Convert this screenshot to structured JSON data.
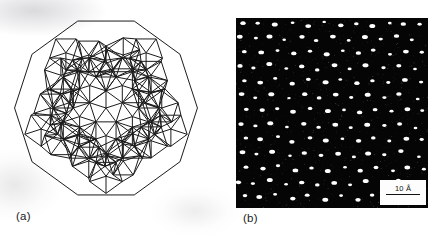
{
  "figure": {
    "type": "two-panel scientific figure",
    "background_color": "#ffffff",
    "width": 437,
    "height": 235
  },
  "panel_a": {
    "label": "(a)",
    "description": "decagonal quasicrystal tiling model",
    "line_color": "#1a1a1a",
    "fill_color": "none",
    "symmetry": "10-fold",
    "bounds": {
      "x": 13,
      "y": 15,
      "width": 177,
      "height": 185
    }
  },
  "panel_b": {
    "label": "(b)",
    "description": "high-resolution electron micrograph of quasicrystal",
    "background_color": "#050505",
    "dot_color": "#ffffff",
    "bounds": {
      "x": 236,
      "y": 18,
      "width": 192,
      "height": 190
    },
    "scalebar": {
      "label": "10 Å",
      "value": 10,
      "unit": "Å",
      "box_color": "#fdfdfd",
      "line_color": "#111111"
    }
  },
  "chart_data": {
    "type": "scatter",
    "title": "",
    "xlabel": "",
    "ylabel": "",
    "note": "Panel (b) bright spots are atomic column positions in a quasiperiodic lattice; coordinates are in micrograph pixel space (0-192 x, 0-190 y) with intensity r = blob radius.",
    "points": [
      [
        7,
        6,
        2.0
      ],
      [
        22,
        5,
        1.6
      ],
      [
        38,
        7,
        2.2
      ],
      [
        56,
        5,
        1.4
      ],
      [
        72,
        8,
        2.1
      ],
      [
        88,
        4,
        1.3
      ],
      [
        104,
        7,
        2.0
      ],
      [
        120,
        5,
        1.7
      ],
      [
        137,
        8,
        2.2
      ],
      [
        153,
        5,
        1.4
      ],
      [
        168,
        7,
        2.0
      ],
      [
        183,
        6,
        1.6
      ],
      [
        4,
        19,
        2.1
      ],
      [
        19,
        21,
        1.5
      ],
      [
        34,
        18,
        2.2
      ],
      [
        49,
        22,
        1.3
      ],
      [
        65,
        19,
        2.0
      ],
      [
        81,
        22,
        1.7
      ],
      [
        97,
        19,
        2.1
      ],
      [
        113,
        23,
        1.4
      ],
      [
        128,
        19,
        2.2
      ],
      [
        145,
        21,
        1.6
      ],
      [
        160,
        18,
        2.0
      ],
      [
        176,
        22,
        1.5
      ],
      [
        9,
        33,
        1.8
      ],
      [
        25,
        35,
        2.1
      ],
      [
        41,
        32,
        1.5
      ],
      [
        57,
        36,
        2.0
      ],
      [
        73,
        33,
        1.6
      ],
      [
        90,
        36,
        2.2
      ],
      [
        106,
        33,
        1.4
      ],
      [
        122,
        36,
        2.0
      ],
      [
        138,
        33,
        1.8
      ],
      [
        154,
        36,
        1.5
      ],
      [
        170,
        33,
        2.1
      ],
      [
        186,
        35,
        1.6
      ],
      [
        3,
        48,
        2.0
      ],
      [
        18,
        50,
        1.6
      ],
      [
        33,
        47,
        2.2
      ],
      [
        50,
        51,
        1.4
      ],
      [
        66,
        48,
        2.0
      ],
      [
        82,
        51,
        1.7
      ],
      [
        98,
        48,
        2.1
      ],
      [
        114,
        51,
        1.5
      ],
      [
        130,
        48,
        2.2
      ],
      [
        147,
        50,
        1.6
      ],
      [
        163,
        47,
        1.9
      ],
      [
        179,
        51,
        1.4
      ],
      [
        8,
        62,
        1.7
      ],
      [
        24,
        64,
        2.1
      ],
      [
        40,
        61,
        1.5
      ],
      [
        56,
        65,
        2.0
      ],
      [
        72,
        62,
        1.8
      ],
      [
        89,
        65,
        2.2
      ],
      [
        105,
        62,
        1.4
      ],
      [
        121,
        65,
        2.0
      ],
      [
        137,
        62,
        1.7
      ],
      [
        153,
        65,
        1.5
      ],
      [
        169,
        62,
        2.1
      ],
      [
        185,
        64,
        1.6
      ],
      [
        5,
        77,
        2.1
      ],
      [
        20,
        79,
        1.5
      ],
      [
        36,
        76,
        2.2
      ],
      [
        52,
        80,
        1.3
      ],
      [
        68,
        77,
        2.0
      ],
      [
        84,
        80,
        1.8
      ],
      [
        100,
        77,
        2.1
      ],
      [
        116,
        80,
        1.5
      ],
      [
        132,
        77,
        2.2
      ],
      [
        148,
        79,
        1.6
      ],
      [
        164,
        76,
        2.0
      ],
      [
        181,
        80,
        1.4
      ],
      [
        10,
        91,
        1.8
      ],
      [
        26,
        93,
        2.0
      ],
      [
        42,
        90,
        1.6
      ],
      [
        58,
        94,
        2.1
      ],
      [
        74,
        91,
        1.7
      ],
      [
        91,
        94,
        2.2
      ],
      [
        107,
        91,
        1.4
      ],
      [
        123,
        94,
        2.0
      ],
      [
        139,
        91,
        1.8
      ],
      [
        155,
        94,
        1.5
      ],
      [
        171,
        91,
        2.1
      ],
      [
        187,
        93,
        1.5
      ],
      [
        4,
        106,
        2.0
      ],
      [
        19,
        108,
        1.6
      ],
      [
        35,
        105,
        2.2
      ],
      [
        51,
        109,
        1.4
      ],
      [
        67,
        106,
        2.0
      ],
      [
        83,
        109,
        1.7
      ],
      [
        99,
        106,
        2.1
      ],
      [
        115,
        109,
        1.5
      ],
      [
        131,
        106,
        2.2
      ],
      [
        148,
        108,
        1.6
      ],
      [
        164,
        105,
        1.9
      ],
      [
        180,
        109,
        1.4
      ],
      [
        9,
        120,
        1.7
      ],
      [
        25,
        122,
        2.1
      ],
      [
        41,
        119,
        1.5
      ],
      [
        57,
        123,
        2.0
      ],
      [
        73,
        120,
        1.8
      ],
      [
        90,
        123,
        2.2
      ],
      [
        106,
        120,
        1.4
      ],
      [
        122,
        123,
        2.0
      ],
      [
        138,
        120,
        1.7
      ],
      [
        154,
        123,
        1.5
      ],
      [
        170,
        120,
        2.1
      ],
      [
        186,
        122,
        1.6
      ],
      [
        6,
        135,
        2.1
      ],
      [
        21,
        137,
        1.5
      ],
      [
        37,
        134,
        2.2
      ],
      [
        53,
        138,
        1.3
      ],
      [
        69,
        135,
        2.0
      ],
      [
        85,
        138,
        1.8
      ],
      [
        101,
        135,
        2.1
      ],
      [
        117,
        138,
        1.5
      ],
      [
        133,
        135,
        2.2
      ],
      [
        149,
        137,
        1.6
      ],
      [
        165,
        134,
        2.0
      ],
      [
        182,
        138,
        1.4
      ],
      [
        11,
        149,
        1.8
      ],
      [
        27,
        151,
        2.0
      ],
      [
        43,
        148,
        1.6
      ],
      [
        59,
        152,
        2.1
      ],
      [
        75,
        149,
        1.7
      ],
      [
        92,
        152,
        2.2
      ],
      [
        108,
        149,
        1.4
      ],
      [
        124,
        152,
        2.0
      ],
      [
        140,
        149,
        1.8
      ],
      [
        156,
        152,
        1.5
      ],
      [
        172,
        149,
        2.1
      ],
      [
        188,
        151,
        1.5
      ],
      [
        3,
        164,
        2.0
      ],
      [
        18,
        166,
        1.6
      ],
      [
        34,
        163,
        2.2
      ],
      [
        50,
        167,
        1.4
      ],
      [
        66,
        164,
        2.0
      ],
      [
        82,
        167,
        1.7
      ],
      [
        98,
        164,
        2.1
      ],
      [
        114,
        167,
        1.5
      ],
      [
        130,
        164,
        2.2
      ],
      [
        147,
        166,
        1.6
      ],
      [
        163,
        163,
        1.9
      ],
      [
        8,
        178,
        1.7
      ],
      [
        24,
        180,
        2.1
      ],
      [
        40,
        177,
        1.5
      ],
      [
        56,
        181,
        2.0
      ],
      [
        72,
        178,
        1.8
      ],
      [
        89,
        181,
        2.2
      ],
      [
        105,
        178,
        1.4
      ],
      [
        121,
        181,
        2.0
      ],
      [
        137,
        178,
        1.7
      ],
      [
        153,
        181,
        1.5
      ]
    ]
  }
}
